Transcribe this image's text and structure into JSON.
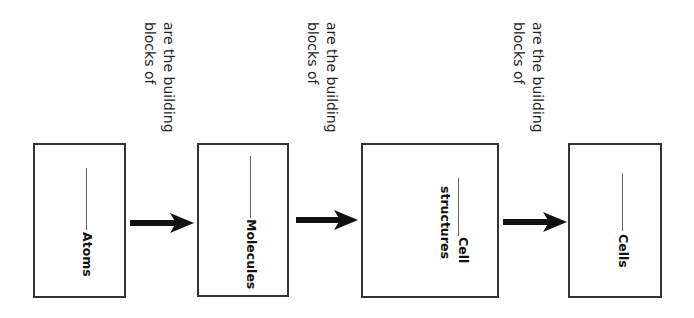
{
  "diagram": {
    "type": "concept-map-flow",
    "direction": "left-to-right",
    "text_orientation": "rotated-90-clockwise",
    "colors": {
      "box_border": "#333333",
      "arrow": "#111111",
      "text": "#1a1a1a",
      "background": "#ffffff"
    },
    "edge_labels": [
      {
        "line1": "are the building",
        "line2": "blocks of"
      },
      {
        "line1": "are the building",
        "line2": "blocks of"
      },
      {
        "line1": "are the building",
        "line2": "blocks of"
      }
    ],
    "nodes": [
      {
        "blank": "______",
        "label": "Atoms"
      },
      {
        "blank": "______",
        "label": "Molecules"
      },
      {
        "blank": "______",
        "label": "Cell",
        "label_line2": "structures"
      },
      {
        "blank": "______",
        "label": "Cells"
      }
    ],
    "arrows": [
      {
        "from": "Atoms",
        "to": "Molecules"
      },
      {
        "from": "Molecules",
        "to": "Cell structures"
      },
      {
        "from": "Cell structures",
        "to": "Cells"
      }
    ]
  }
}
